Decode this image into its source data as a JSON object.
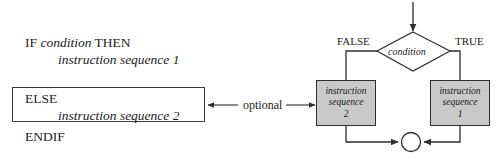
{
  "diagram": {
    "colors": {
      "box_fill": "#c9c9c9",
      "stroke": "#2e2e2e",
      "text": "#1c1c1c",
      "background": "#ffffff"
    }
  },
  "pseudocode": {
    "if_keyword": "IF",
    "if_condition": "condition",
    "then_keyword": "THEN",
    "if_line": "IF condition THEN",
    "sequence_1": "instruction sequence 1",
    "else_keyword": "ELSE",
    "sequence_2": "instruction sequence 2",
    "endif_keyword": "ENDIF"
  },
  "flowchart": {
    "decision_label": "condition",
    "branch_false_label": "FALSE",
    "branch_true_label": "TRUE",
    "process_false": {
      "line1": "instruction",
      "line2": "sequence",
      "line3": "2"
    },
    "process_true": {
      "line1": "instruction",
      "line2": "sequence",
      "line3": "1"
    },
    "merge_node": "connector-circle",
    "entry_arrow": "entry-arrow-down"
  },
  "annotation": {
    "optional_label": "optional"
  }
}
